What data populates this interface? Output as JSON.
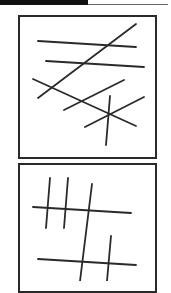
{
  "figure": {
    "panels": [
      {
        "name": "panel-1",
        "description": "Lines with many crossings",
        "lines": [
          [
            38,
            41,
            136,
            47
          ],
          [
            46,
            61,
            144,
            67
          ],
          [
            38,
            98,
            136,
            24
          ],
          [
            33,
            79,
            136,
            126
          ],
          [
            64,
            110,
            124,
            80
          ],
          [
            85,
            127,
            144,
            97
          ],
          [
            110,
            96,
            106,
            145
          ]
        ]
      },
      {
        "name": "panel-2",
        "description": "Hash-like line pattern",
        "lines": [
          [
            50,
            178,
            46,
            228
          ],
          [
            68,
            178,
            64,
            228
          ],
          [
            92,
            184,
            80,
            281
          ],
          [
            33,
            207,
            131,
            213
          ],
          [
            111,
            236,
            107,
            281
          ],
          [
            38,
            259,
            136,
            265
          ]
        ]
      }
    ],
    "colors": {
      "stroke": "#2a2a2a",
      "background": "#ffffff"
    }
  }
}
